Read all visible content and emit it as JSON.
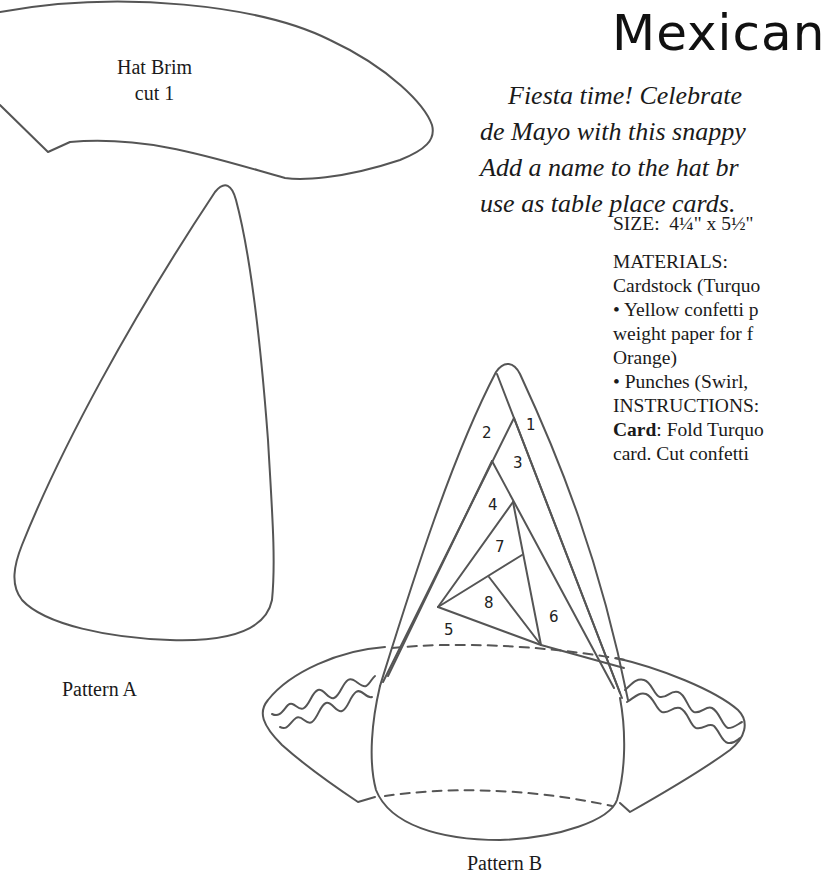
{
  "header": {
    "title": "Mexican",
    "intro_lines": [
      "Fiesta time! Celebrate",
      "de Mayo with this snappy",
      "Add a name to the hat br",
      "use as table place cards."
    ]
  },
  "details": {
    "size_label": "SIZE:",
    "size_value": "4¼\" x 5½\"",
    "materials_label": "MATERIALS:",
    "materials_lines": [
      "Cardstock (Turquo",
      "• Yellow confetti p",
      "weight paper for f",
      "Orange)",
      "• Punches (Swirl,"
    ],
    "instructions_label": "INSTRUCTIONS:",
    "instructions_bold": "Card",
    "instructions_lines": [
      ": Fold Turquo",
      "card. Cut confetti"
    ]
  },
  "patterns": {
    "brim_label_line1": "Hat Brim",
    "brim_label_line2": "cut 1",
    "pattern_a_label": "Pattern A",
    "pattern_b_label": "Pattern B",
    "piece_numbers": [
      "1",
      "2",
      "3",
      "4",
      "5",
      "6",
      "7",
      "8"
    ]
  }
}
